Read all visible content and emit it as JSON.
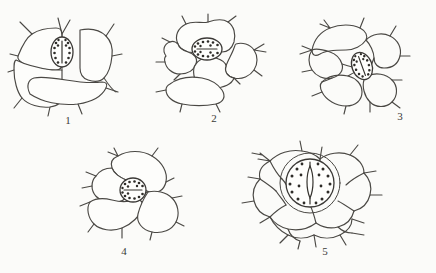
{
  "plate": {
    "title": "Stomata types in plant epidermis",
    "background_color": "#fbfbf9",
    "ink_color": "#4a4844",
    "figure_count": 5
  },
  "figures": [
    {
      "id": "figure-1",
      "caption": "1",
      "name": "anomocytic-stoma-angular-cells",
      "description": "Stoma with vertical elliptical guard cells surrounded by four large angular epidermal cells with nearly straight walls",
      "stoma": {
        "shape": "ellipse",
        "orientation": "vertical",
        "pore_axis": "vertical",
        "granule_count": 14,
        "rx": 11,
        "ry": 15
      },
      "surrounding_cell_count": 5,
      "wall_style": "straight-angular",
      "center": {
        "x": 68,
        "y": 60
      },
      "caption_position": {
        "x": 68,
        "y": 122
      }
    },
    {
      "id": "figure-2",
      "caption": "2",
      "name": "anomocytic-stoma-wavy-cells",
      "description": "Stoma with horizontal elliptical guard cells surrounded by epidermal cells having strongly undulating sinuous walls",
      "stoma": {
        "shape": "ellipse",
        "orientation": "horizontal",
        "pore_axis": "horizontal",
        "granule_count": 16,
        "rx": 15,
        "ry": 11
      },
      "surrounding_cell_count": 5,
      "wall_style": "wavy-sinuous",
      "center": {
        "x": 213,
        "y": 60
      },
      "caption_position": {
        "x": 214,
        "y": 120
      }
    },
    {
      "id": "figure-3",
      "caption": "3",
      "name": "anomocytic-stoma-oblique",
      "description": "Obliquely tilted elliptical stoma set among loosely arranged wavy-walled epidermal cells",
      "stoma": {
        "shape": "ellipse",
        "orientation": "oblique",
        "rotation_degrees": -20,
        "pore_axis": "oblique",
        "granule_count": 14,
        "rx": 10,
        "ry": 14
      },
      "surrounding_cell_count": 5,
      "wall_style": "wavy-open",
      "center": {
        "x": 360,
        "y": 62
      },
      "caption_position": {
        "x": 400,
        "y": 118
      }
    },
    {
      "id": "figure-4",
      "caption": "4",
      "name": "anomocytic-stoma-rounded-cells",
      "description": "Nearly circular stoma at upper left of a group of three large lobed epidermal cells",
      "stoma": {
        "shape": "ellipse",
        "orientation": "horizontal",
        "pore_axis": "horizontal",
        "granule_count": 15,
        "rx": 13,
        "ry": 12
      },
      "surrounding_cell_count": 4,
      "wall_style": "lobed-wavy",
      "center": {
        "x": 133,
        "y": 190
      },
      "caption_position": {
        "x": 124,
        "y": 253
      }
    },
    {
      "id": "figure-5",
      "caption": "5",
      "name": "cyclocytic-stoma-ringed",
      "description": "Large circular stoma encircled by a ring of subsidiary cells, surrounded by many small branching epidermal cells",
      "stoma": {
        "shape": "circle",
        "orientation": "vertical",
        "pore_axis": "vertical",
        "granule_count": 18,
        "radius": 24,
        "has_subsidiary_ring": true
      },
      "surrounding_cell_count": 8,
      "wall_style": "branching-irregular",
      "center": {
        "x": 310,
        "y": 180
      },
      "caption_position": {
        "x": 325,
        "y": 253
      }
    }
  ]
}
